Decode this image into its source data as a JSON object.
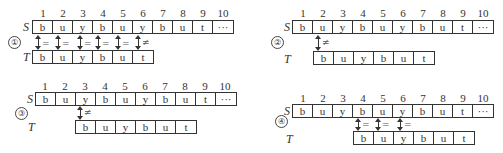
{
  "labels": {
    "S": "S",
    "T": "T"
  },
  "indices": [
    "1",
    "2",
    "3",
    "4",
    "5",
    "6",
    "7",
    "8",
    "9",
    "10"
  ],
  "S": [
    "b",
    "u",
    "y",
    "b",
    "u",
    "y",
    "b",
    "u",
    "t",
    "···"
  ],
  "T": [
    "b",
    "u",
    "y",
    "b",
    "u",
    "t"
  ],
  "panels": [
    {
      "id": "①",
      "t_offset": 0,
      "comparisons": [
        "=",
        "=",
        "=",
        "=",
        "=",
        "≠"
      ]
    },
    {
      "id": "②",
      "t_offset": 1,
      "comparisons": [
        "≠"
      ]
    },
    {
      "id": "③",
      "t_offset": 2,
      "comparisons": [
        "≠"
      ]
    },
    {
      "id": "④",
      "t_offset": 3,
      "comparisons": [
        "=",
        "=",
        "="
      ]
    }
  ]
}
